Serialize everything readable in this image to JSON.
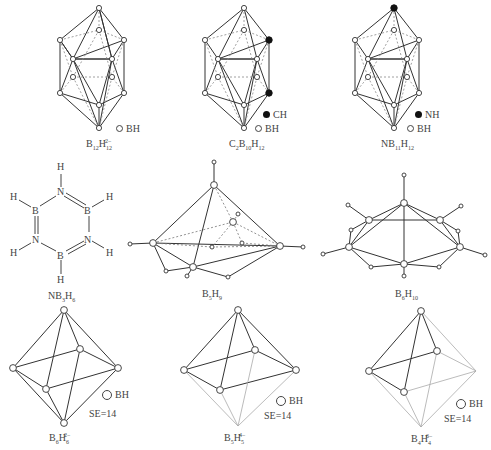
{
  "figure": {
    "top_caption_fragment": "...(clipped caption text at top edge)..."
  },
  "legend": {
    "bh": "BH",
    "ch": "CH",
    "nh": "NH"
  },
  "panels": [
    {
      "id": "b12h12",
      "formula_main": "B",
      "sub1": "12",
      "mid": "H",
      "sub2": "12",
      "sup": "2−",
      "legend": [
        "BH"
      ]
    },
    {
      "id": "c2b10h12",
      "formula_prefix": "C",
      "sub0": "2",
      "formula_main": "B",
      "sub1": "10",
      "mid": "H",
      "sub2": "12",
      "legend": [
        "CH",
        "BH"
      ]
    },
    {
      "id": "nb11h12",
      "formula_prefix": "N",
      "formula_main": "B",
      "sub1": "11",
      "mid": "H",
      "sub2": "12",
      "legend": [
        "NH",
        "BH"
      ]
    },
    {
      "id": "nb3h6",
      "formula_prefix": "N",
      "formula_main": "B",
      "sub1": "3",
      "mid": "H",
      "sub2": "6"
    },
    {
      "id": "b5h9",
      "formula_main": "B",
      "sub1": "5",
      "mid": "H",
      "sub2": "9"
    },
    {
      "id": "b6h10",
      "formula_main": "B",
      "sub1": "6",
      "mid": "H",
      "sub2": "10"
    },
    {
      "id": "b6h6",
      "formula_main": "B",
      "sub1": "6",
      "mid": "H",
      "sub2": "6",
      "sup": "2−",
      "se": "SE=14",
      "legend": [
        "BH"
      ]
    },
    {
      "id": "b5h5",
      "formula_main": "B",
      "sub1": "5",
      "mid": "H",
      "sub2": "5",
      "sup": "4−",
      "se": "SE=14",
      "legend": [
        "BH"
      ]
    },
    {
      "id": "b4h4",
      "formula_main": "B",
      "sub1": "4",
      "mid": "H",
      "sub2": "4",
      "sup": "6−",
      "se": "SE=14",
      "legend": [
        "BH"
      ]
    }
  ],
  "borazine_atoms": {
    "n": "N",
    "b": "B",
    "h": "H"
  }
}
